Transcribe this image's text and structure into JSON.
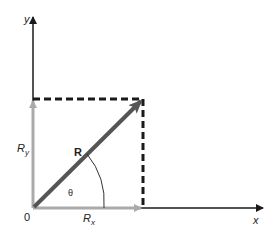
{
  "diagram": {
    "type": "vector-components",
    "labels": {
      "y_axis": "y",
      "x_axis": "x",
      "origin": "0",
      "vector": "R",
      "angle": "θ",
      "ry_main": "R",
      "ry_sub": "y",
      "rx_main": "R",
      "rx_sub": "x"
    },
    "colors": {
      "axis": "#1a1a1a",
      "vector": "#555555",
      "component": "#aaaaaa",
      "dashed": "#1a1a1a",
      "arc": "#333333"
    },
    "geometry": {
      "origin": [
        33,
        208
      ],
      "y_axis_top": [
        33,
        16
      ],
      "x_axis_end": [
        264,
        208
      ],
      "vector_tip": [
        143,
        99
      ],
      "dashed_corner": [
        143,
        99
      ]
    }
  }
}
